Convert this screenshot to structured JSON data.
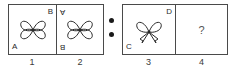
{
  "puzzle": {
    "type": "analogy-figure-matrix",
    "separator": {
      "icon": "two-dots-analogy-separator",
      "dots": 2
    },
    "groups": [
      {
        "name": "left-pair",
        "cells": [
          {
            "number": "1",
            "figure": "four-petal-flower",
            "figure_orientation": "upright",
            "labels": [
              {
                "text": "B",
                "position": "top-right",
                "rotated": false
              },
              {
                "text": "A",
                "position": "bottom-left",
                "rotated": false
              }
            ]
          },
          {
            "number": "2",
            "figure": "four-petal-flower",
            "figure_orientation": "rotated-180",
            "labels": [
              {
                "text": "A",
                "position": "top-left",
                "rotated": true
              },
              {
                "text": "B",
                "position": "bottom-left",
                "rotated": true
              }
            ]
          }
        ]
      },
      {
        "name": "right-pair",
        "cells": [
          {
            "number": "3",
            "figure": "butterfly",
            "figure_orientation": "upright",
            "labels": [
              {
                "text": "D",
                "position": "top-right",
                "rotated": false
              },
              {
                "text": "C",
                "position": "bottom-left",
                "rotated": false
              }
            ]
          },
          {
            "number": "4",
            "figure": "question-mark",
            "figure_orientation": "upright",
            "question_mark": "?",
            "labels": []
          }
        ]
      }
    ]
  },
  "colors": {
    "stroke": "#2a2a2a",
    "border": "#4a4a4a",
    "background": "#ffffff",
    "dot": "#1a1a1a",
    "caption": "#3a3a3a"
  }
}
